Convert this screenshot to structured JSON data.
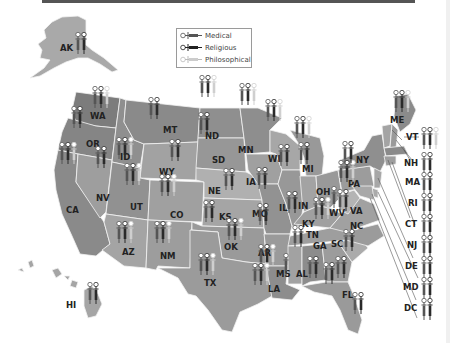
{
  "legend": {
    "items": [
      {
        "label": "Medical",
        "color": "#666666"
      },
      {
        "label": "Religious",
        "color": "#333333"
      },
      {
        "label": "Philosophical",
        "color": "#c8c8c8"
      }
    ]
  },
  "colors": {
    "medical": "#555555",
    "religious": "#2a2a2a",
    "philosophical": "#cfcfcf",
    "state_dark": "#7a7a7a",
    "state_mid": "#8f8f8f",
    "state_light": "#a8a8a8"
  },
  "states": [
    {
      "abbr": "AK",
      "exemptions": [
        "Medical",
        "Religious"
      ]
    },
    {
      "abbr": "WA",
      "exemptions": [
        "Medical",
        "Religious",
        "Philosophical"
      ]
    },
    {
      "abbr": "OR",
      "exemptions": [
        "Medical",
        "Religious"
      ]
    },
    {
      "abbr": "CA",
      "exemptions": [
        "Medical",
        "Religious",
        "Philosophical"
      ]
    },
    {
      "abbr": "ID",
      "exemptions": [
        "Medical",
        "Religious",
        "Philosophical"
      ]
    },
    {
      "abbr": "NV",
      "exemptions": [
        "Medical",
        "Religious"
      ]
    },
    {
      "abbr": "MT",
      "exemptions": [
        "Medical",
        "Religious"
      ]
    },
    {
      "abbr": "WY",
      "exemptions": [
        "Medical",
        "Religious"
      ]
    },
    {
      "abbr": "UT",
      "exemptions": [
        "Medical",
        "Religious",
        "Philosophical"
      ]
    },
    {
      "abbr": "AZ",
      "exemptions": [
        "Medical",
        "Religious",
        "Philosophical"
      ]
    },
    {
      "abbr": "CO",
      "exemptions": [
        "Medical",
        "Religious",
        "Philosophical"
      ]
    },
    {
      "abbr": "NM",
      "exemptions": [
        "Medical",
        "Religious",
        "Philosophical"
      ]
    },
    {
      "abbr": "ND",
      "exemptions": [
        "Medical",
        "Religious",
        "Philosophical"
      ]
    },
    {
      "abbr": "SD",
      "exemptions": [
        "Medical",
        "Religious"
      ]
    },
    {
      "abbr": "NE",
      "exemptions": [
        "Medical",
        "Religious"
      ]
    },
    {
      "abbr": "KS",
      "exemptions": [
        "Medical",
        "Religious"
      ]
    },
    {
      "abbr": "OK",
      "exemptions": [
        "Medical",
        "Religious",
        "Philosophical"
      ]
    },
    {
      "abbr": "TX",
      "exemptions": [
        "Medical",
        "Religious",
        "Philosophical"
      ]
    },
    {
      "abbr": "MN",
      "exemptions": [
        "Medical",
        "Religious",
        "Philosophical"
      ]
    },
    {
      "abbr": "IA",
      "exemptions": [
        "Medical",
        "Religious"
      ]
    },
    {
      "abbr": "MO",
      "exemptions": [
        "Medical",
        "Religious"
      ]
    },
    {
      "abbr": "AR",
      "exemptions": [
        "Medical",
        "Religious",
        "Philosophical"
      ]
    },
    {
      "abbr": "LA",
      "exemptions": [
        "Medical",
        "Religious",
        "Philosophical"
      ]
    },
    {
      "abbr": "WI",
      "exemptions": [
        "Medical",
        "Religious",
        "Philosophical"
      ]
    },
    {
      "abbr": "IL",
      "exemptions": [
        "Medical",
        "Religious"
      ]
    },
    {
      "abbr": "MI",
      "exemptions": [
        "Medical",
        "Religious",
        "Philosophical"
      ]
    },
    {
      "abbr": "IN",
      "exemptions": [
        "Medical",
        "Religious"
      ]
    },
    {
      "abbr": "OH",
      "exemptions": [
        "Medical",
        "Religious",
        "Philosophical"
      ]
    },
    {
      "abbr": "KY",
      "exemptions": [
        "Medical",
        "Religious"
      ]
    },
    {
      "abbr": "TN",
      "exemptions": [
        "Medical",
        "Religious"
      ]
    },
    {
      "abbr": "MS",
      "exemptions": [
        "Medical"
      ]
    },
    {
      "abbr": "AL",
      "exemptions": [
        "Medical",
        "Religious"
      ]
    },
    {
      "abbr": "GA",
      "exemptions": [
        "Medical",
        "Religious"
      ]
    },
    {
      "abbr": "FL",
      "exemptions": [
        "Medical",
        "Religious"
      ]
    },
    {
      "abbr": "SC",
      "exemptions": [
        "Medical",
        "Religious"
      ]
    },
    {
      "abbr": "NC",
      "exemptions": [
        "Medical",
        "Religious"
      ]
    },
    {
      "abbr": "VA",
      "exemptions": [
        "Medical",
        "Religious"
      ]
    },
    {
      "abbr": "WV",
      "exemptions": [
        "Medical"
      ]
    },
    {
      "abbr": "PA",
      "exemptions": [
        "Medical",
        "Religious",
        "Philosophical"
      ]
    },
    {
      "abbr": "NY",
      "exemptions": [
        "Medical",
        "Religious"
      ]
    },
    {
      "abbr": "ME",
      "exemptions": [
        "Medical",
        "Religious",
        "Philosophical"
      ]
    },
    {
      "abbr": "VT",
      "exemptions": [
        "Medical",
        "Religious",
        "Philosophical"
      ]
    },
    {
      "abbr": "NH",
      "exemptions": [
        "Medical",
        "Religious"
      ]
    },
    {
      "abbr": "MA",
      "exemptions": [
        "Medical",
        "Religious"
      ]
    },
    {
      "abbr": "RI",
      "exemptions": [
        "Medical",
        "Religious"
      ]
    },
    {
      "abbr": "CT",
      "exemptions": [
        "Medical",
        "Religious"
      ]
    },
    {
      "abbr": "NJ",
      "exemptions": [
        "Medical",
        "Religious"
      ]
    },
    {
      "abbr": "DE",
      "exemptions": [
        "Medical",
        "Religious"
      ]
    },
    {
      "abbr": "MD",
      "exemptions": [
        "Medical",
        "Religious"
      ]
    },
    {
      "abbr": "DC",
      "exemptions": [
        "Medical",
        "Religious"
      ]
    },
    {
      "abbr": "HI",
      "exemptions": [
        "Medical",
        "Religious"
      ]
    }
  ],
  "labels": {
    "AK": "AK",
    "WA": "WA",
    "OR": "OR",
    "CA": "CA",
    "ID": "ID",
    "NV": "NV",
    "MT": "MT",
    "WY": "WY",
    "UT": "UT",
    "AZ": "AZ",
    "CO": "CO",
    "NM": "NM",
    "ND": "ND",
    "SD": "SD",
    "NE": "NE",
    "KS": "KS",
    "OK": "OK",
    "TX": "TX",
    "MN": "MN",
    "IA": "IA",
    "MO": "MO",
    "AR": "AR",
    "LA": "LA",
    "WI": "WI",
    "IL": "IL",
    "MI": "MI",
    "IN": "IN",
    "OH": "OH",
    "KY": "KY",
    "TN": "TN",
    "MS": "MS",
    "AL": "AL",
    "GA": "GA",
    "FL": "FL",
    "SC": "SC",
    "NC": "NC",
    "VA": "VA",
    "WV": "WV",
    "PA": "PA",
    "NY": "NY",
    "ME": "ME",
    "VT": "VT",
    "NH": "NH",
    "MA": "MA",
    "RI": "RI",
    "CT": "CT",
    "NJ": "NJ",
    "DE": "DE",
    "MD": "MD",
    "DC": "DC",
    "HI": "HI"
  }
}
